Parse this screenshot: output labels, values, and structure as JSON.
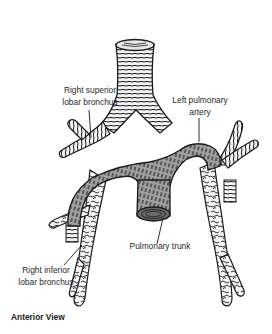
{
  "figure": {
    "caption": "Anterior View",
    "labels": {
      "right_superior_lobar_bronchus": {
        "line1": "Right superior",
        "line2": "lobar bronchus"
      },
      "left_pulmonary_artery": {
        "line1": "Left pulmonary",
        "line2": "artery"
      },
      "pulmonary_trunk": {
        "line1": "Pulmonary trunk"
      },
      "right_inferior_lobar_bronchus": {
        "line1": "Right inferior",
        "line2": "lobar bronchus"
      }
    },
    "structures": [
      "trachea",
      "right main bronchus",
      "left main bronchus",
      "right pulmonary artery",
      "left pulmonary artery",
      "pulmonary trunk",
      "right superior lobar bronchus",
      "right inferior lobar bronchus",
      "left lower bronchi"
    ],
    "colors": {
      "ink": "#1a1a1a",
      "artery_fill": "#9a9a9a",
      "bronchus_fill": "#f2f2f2",
      "background": "#ffffff"
    }
  }
}
